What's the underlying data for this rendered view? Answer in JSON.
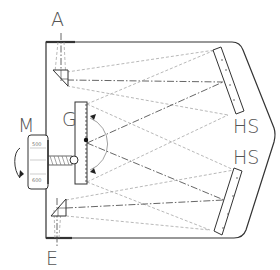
{
  "diagram": {
    "type": "monochromator schematic",
    "labels": {
      "entrance_slit": "A",
      "exit_slit": "E",
      "grating": "G",
      "drive": "M",
      "mirror_top": "HS",
      "mirror_bottom": "HS"
    },
    "dial": {
      "top_value": "500",
      "bottom_value": "600"
    },
    "colors": {
      "line": "#333333",
      "ray": "#999999",
      "label": "#555555",
      "background": "#ffffff"
    }
  }
}
